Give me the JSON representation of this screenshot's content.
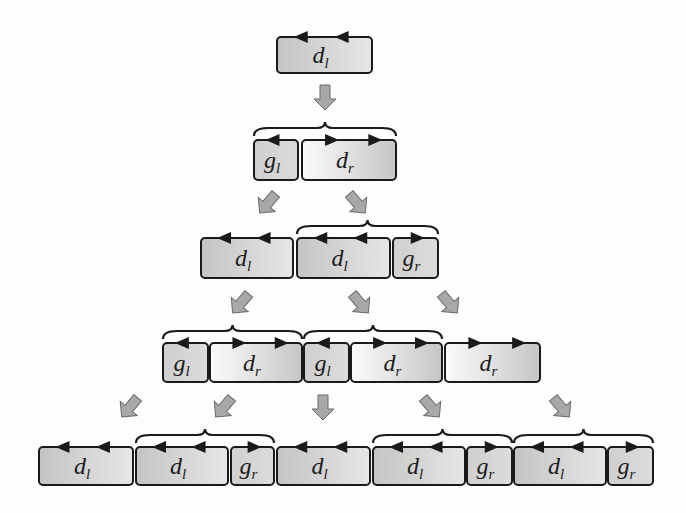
{
  "diagram": {
    "width": 686,
    "height": 513,
    "colors": {
      "stroke": "#1a1a1a",
      "box_dark": "#c8c8c8",
      "box_light": "#f6f6f6",
      "arrow_fill": "#a8a8a8",
      "arrow_stroke": "#6a6a6a",
      "background": "#fdfdfd"
    },
    "rows": [
      {
        "y": 37,
        "h": 36,
        "boxes": [
          {
            "x": 277,
            "w": 95,
            "label": "d",
            "sub": "l",
            "fill": "dl",
            "arrows": "left2"
          }
        ],
        "braces": []
      },
      {
        "y": 140,
        "h": 40,
        "boxes": [
          {
            "x": 254,
            "w": 44,
            "label": "g",
            "sub": "l",
            "fill": "g",
            "arrows": "left1"
          },
          {
            "x": 302,
            "w": 94,
            "label": "d",
            "sub": "r",
            "fill": "dr",
            "arrows": "right2"
          }
        ],
        "braces": [
          {
            "x1": 254,
            "x2": 396
          }
        ]
      },
      {
        "y": 238,
        "h": 40,
        "boxes": [
          {
            "x": 201,
            "w": 92,
            "label": "d",
            "sub": "l",
            "fill": "dl",
            "arrows": "left2"
          },
          {
            "x": 297,
            "w": 93,
            "label": "d",
            "sub": "l",
            "fill": "dl",
            "arrows": "left2"
          },
          {
            "x": 393,
            "w": 45,
            "label": "g",
            "sub": "r",
            "fill": "g",
            "arrows": "right1"
          }
        ],
        "braces": [
          {
            "x1": 297,
            "x2": 438
          }
        ]
      },
      {
        "y": 343,
        "h": 39,
        "boxes": [
          {
            "x": 163,
            "w": 45,
            "label": "g",
            "sub": "l",
            "fill": "g",
            "arrows": "left1"
          },
          {
            "x": 210,
            "w": 92,
            "label": "d",
            "sub": "r",
            "fill": "dr",
            "arrows": "right2"
          },
          {
            "x": 304,
            "w": 45,
            "label": "g",
            "sub": "l",
            "fill": "g",
            "arrows": "left1"
          },
          {
            "x": 351,
            "w": 91,
            "label": "d",
            "sub": "r",
            "fill": "dr",
            "arrows": "right2"
          },
          {
            "x": 445,
            "w": 95,
            "label": "d",
            "sub": "r",
            "fill": "dr",
            "arrows": "right2"
          }
        ],
        "braces": [
          {
            "x1": 163,
            "x2": 302
          },
          {
            "x1": 304,
            "x2": 442
          }
        ]
      },
      {
        "y": 447,
        "h": 38,
        "boxes": [
          {
            "x": 39,
            "w": 94,
            "label": "d",
            "sub": "l",
            "fill": "dl",
            "arrows": "left2"
          },
          {
            "x": 136,
            "w": 92,
            "label": "d",
            "sub": "l",
            "fill": "dl",
            "arrows": "left2"
          },
          {
            "x": 231,
            "w": 43,
            "label": "g",
            "sub": "r",
            "fill": "g",
            "arrows": "right1"
          },
          {
            "x": 277,
            "w": 93,
            "label": "d",
            "sub": "l",
            "fill": "dl",
            "arrows": "left2"
          },
          {
            "x": 373,
            "w": 92,
            "label": "d",
            "sub": "l",
            "fill": "dl",
            "arrows": "left2"
          },
          {
            "x": 467,
            "w": 45,
            "label": "g",
            "sub": "r",
            "fill": "g",
            "arrows": "right1"
          },
          {
            "x": 514,
            "w": 92,
            "label": "d",
            "sub": "l",
            "fill": "dl",
            "arrows": "left2"
          },
          {
            "x": 608,
            "w": 45,
            "label": "g",
            "sub": "r",
            "fill": "g",
            "arrows": "right1"
          }
        ],
        "braces": [
          {
            "x1": 136,
            "x2": 274
          },
          {
            "x1": 373,
            "x2": 512
          },
          {
            "x1": 514,
            "x2": 653
          }
        ]
      }
    ],
    "transition_arrows": [
      {
        "x": 325,
        "y": 97,
        "dir": "down"
      },
      {
        "x": 268,
        "y": 203,
        "dir": "down-left"
      },
      {
        "x": 357,
        "y": 203,
        "dir": "down-right"
      },
      {
        "x": 241,
        "y": 303,
        "dir": "down-left"
      },
      {
        "x": 360,
        "y": 303,
        "dir": "down-right"
      },
      {
        "x": 449,
        "y": 303,
        "dir": "down-right"
      },
      {
        "x": 130,
        "y": 407,
        "dir": "down-left"
      },
      {
        "x": 224,
        "y": 407,
        "dir": "down-left"
      },
      {
        "x": 323,
        "y": 407,
        "dir": "down"
      },
      {
        "x": 431,
        "y": 407,
        "dir": "down-right"
      },
      {
        "x": 561,
        "y": 407,
        "dir": "down-right"
      }
    ]
  }
}
